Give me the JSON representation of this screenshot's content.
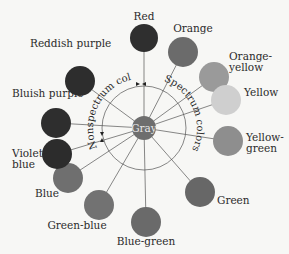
{
  "diagram": {
    "center": {
      "label": "Gray",
      "x": 144,
      "y": 128,
      "r": 12,
      "color": "#6e6e6e"
    },
    "ring_radius": 42,
    "arc_labels": {
      "nonspectrum": "Nonspectrum colors",
      "spectrum": "Spectrum colors"
    },
    "nodes": [
      {
        "label": "Red",
        "lines": [
          "Red"
        ],
        "x": 144,
        "y": 38,
        "r": 14,
        "color": "#2f2f2f",
        "lx": 144,
        "ly": 20,
        "anchor": "middle"
      },
      {
        "label": "Orange",
        "lines": [
          "Orange"
        ],
        "x": 183,
        "y": 52,
        "r": 15,
        "color": "#6b6b6b",
        "lx": 193,
        "ly": 32,
        "anchor": "middle"
      },
      {
        "label": "Orange-yellow",
        "lines": [
          "Orange-",
          "yellow"
        ],
        "x": 214,
        "y": 77,
        "r": 15,
        "color": "#9a9a9a",
        "lx": 229,
        "ly": 60,
        "anchor": "start"
      },
      {
        "label": "Yellow",
        "lines": [
          "Yellow"
        ],
        "x": 226,
        "y": 100,
        "r": 15,
        "color": "#cfcfcf",
        "lx": 244,
        "ly": 96,
        "anchor": "start"
      },
      {
        "label": "Yellow-green",
        "lines": [
          "Yellow-",
          "green"
        ],
        "x": 228,
        "y": 141,
        "r": 15,
        "color": "#8e8e8e",
        "lx": 246,
        "ly": 141,
        "anchor": "start"
      },
      {
        "label": "Green",
        "lines": [
          "Green"
        ],
        "x": 200,
        "y": 192,
        "r": 15,
        "color": "#676767",
        "lx": 217,
        "ly": 204,
        "anchor": "start"
      },
      {
        "label": "Blue-green",
        "lines": [
          "Blue-green"
        ],
        "x": 146,
        "y": 222,
        "r": 15,
        "color": "#6a6a6a",
        "lx": 146,
        "ly": 245,
        "anchor": "middle"
      },
      {
        "label": "Green-blue",
        "lines": [
          "Green-blue"
        ],
        "x": 99,
        "y": 205,
        "r": 15,
        "color": "#727272",
        "lx": 77,
        "ly": 229,
        "anchor": "middle"
      },
      {
        "label": "Blue",
        "lines": [
          "Blue"
        ],
        "x": 68,
        "y": 178,
        "r": 15,
        "color": "#6f6f6f",
        "lx": 47,
        "ly": 197,
        "anchor": "middle"
      },
      {
        "label": "Violet-blue",
        "lines": [
          "Violet-",
          "blue"
        ],
        "x": 57,
        "y": 154,
        "r": 15,
        "color": "#2c2c2c",
        "lx": 12,
        "ly": 157,
        "anchor": "start"
      },
      {
        "label": "Bluish purple",
        "lines": [
          "Bluish purple"
        ],
        "x": 56,
        "y": 123,
        "r": 15,
        "color": "#2e2e2e",
        "lx": 12,
        "ly": 97,
        "anchor": "start"
      },
      {
        "label": "Reddish purple",
        "lines": [
          "Reddish purple"
        ],
        "x": 80,
        "y": 81,
        "r": 15,
        "color": "#2d2d2d",
        "lx": 30,
        "ly": 47,
        "anchor": "start"
      }
    ]
  }
}
